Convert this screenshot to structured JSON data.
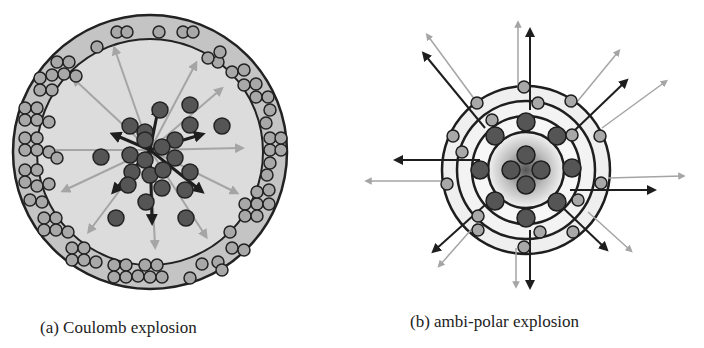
{
  "figure": {
    "panels": [
      {
        "id": "a",
        "caption": "(a) Coulomb explosion",
        "description": "Dense cluster of dark ions in center with black arrows; gray electrons in outer shell; gray arrows radiating outward"
      },
      {
        "id": "b",
        "caption": "(b) ambi-polar explosion",
        "description": "Concentric rings with dark ions and gray electrons; black and gray arrows radiating outward in pairs"
      }
    ],
    "colors": {
      "ion": "#555555",
      "electron": "#a8a8a8",
      "outline": "#222222",
      "shell_fill": "#c4c4c4",
      "inner_fill": "#dcdcdc",
      "arrow_dark": "#222222",
      "arrow_light": "#a5a5a5"
    }
  }
}
